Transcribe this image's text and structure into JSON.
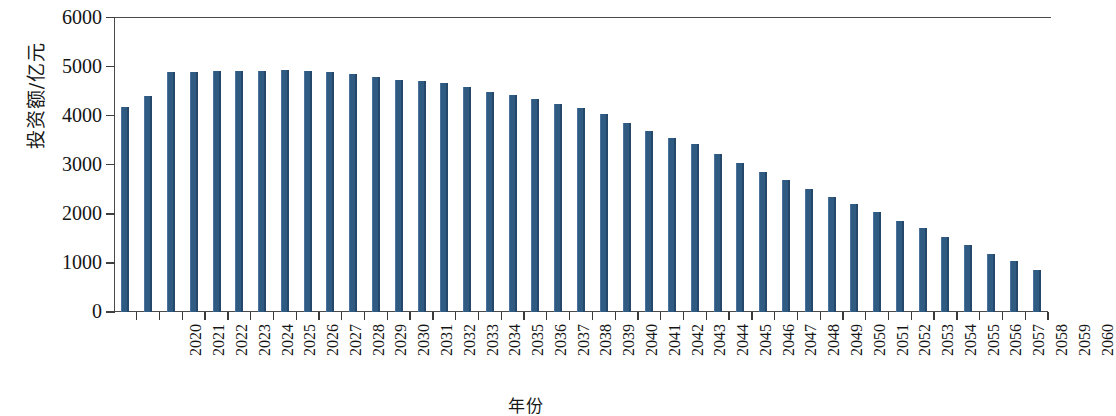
{
  "chart_data": {
    "type": "bar",
    "title": "",
    "subtitle": "",
    "xlabel": "年份",
    "ylabel": "投资额/亿元",
    "ylim": [
      0,
      6000
    ],
    "ytick_labels": [
      "0",
      "1000",
      "2000",
      "3000",
      "4000",
      "5000",
      "6000"
    ],
    "ytick_values": [
      0,
      1000,
      2000,
      3000,
      4000,
      5000,
      6000
    ],
    "grid": false,
    "legend": null,
    "bar_color": "#2f5b83",
    "axis_color": "#4a4a4a",
    "categories": [
      "2020",
      "2021",
      "2022",
      "2023",
      "2024",
      "2025",
      "2026",
      "2027",
      "2028",
      "2029",
      "2030",
      "2031",
      "2032",
      "2033",
      "2034",
      "2035",
      "2036",
      "2037",
      "2038",
      "2039",
      "2040",
      "2041",
      "2042",
      "2043",
      "2044",
      "2045",
      "2046",
      "2047",
      "2048",
      "2049",
      "2050",
      "2051",
      "2052",
      "2053",
      "2054",
      "2055",
      "2056",
      "2057",
      "2058",
      "2059",
      "2060"
    ],
    "values": [
      4170,
      4410,
      4890,
      4880,
      4910,
      4900,
      4920,
      4940,
      4900,
      4890,
      4840,
      4780,
      4730,
      4700,
      4660,
      4590,
      4480,
      4420,
      4340,
      4230,
      4160,
      4030,
      3860,
      3690,
      3550,
      3420,
      3210,
      3030,
      2850,
      2680,
      2510,
      2340,
      2200,
      2030,
      1860,
      1710,
      1520,
      1360,
      1190,
      1030,
      860
    ]
  }
}
